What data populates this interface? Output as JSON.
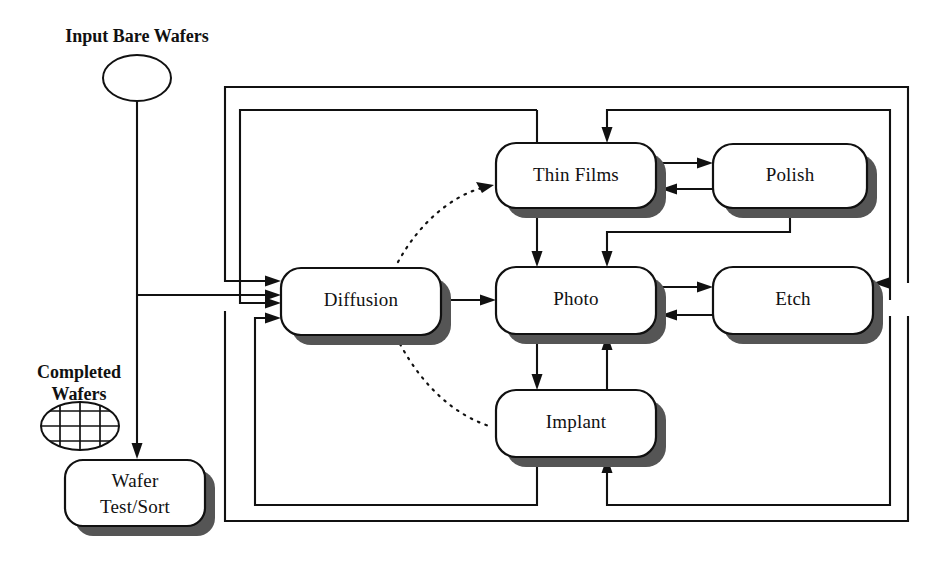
{
  "diagram": {
    "type": "flowchart",
    "canvas": {
      "width": 939,
      "height": 561
    },
    "colors": {
      "stroke": "#111111",
      "fill": "#ffffff",
      "shadow": "#555555",
      "background": "#ffffff"
    }
  },
  "captions": {
    "input": {
      "line1": "Input Bare Wafers"
    },
    "completed": {
      "line1": "Completed",
      "line2": "Wafers"
    }
  },
  "terminals": [
    {
      "id": "input-bare-wafers",
      "shape": "ellipse",
      "label": "",
      "cx": 137,
      "cy": 78,
      "rx": 34,
      "ry": 23
    },
    {
      "id": "completed-wafers",
      "shape": "ellipse-grid",
      "label": "",
      "cx": 80,
      "cy": 426,
      "rx": 39,
      "ry": 24
    }
  ],
  "nodes": [
    {
      "id": "diffusion",
      "label": "Diffusion",
      "x": 281,
      "y": 268,
      "w": 160,
      "h": 67,
      "lines": 1
    },
    {
      "id": "thin-films",
      "label": "Thin Films",
      "x": 496,
      "y": 143,
      "w": 160,
      "h": 65,
      "lines": 1
    },
    {
      "id": "polish",
      "label": "Polish",
      "x": 713,
      "y": 144,
      "w": 154,
      "h": 64,
      "lines": 1
    },
    {
      "id": "photo",
      "label": "Photo",
      "x": 496,
      "y": 267,
      "w": 160,
      "h": 67,
      "lines": 1
    },
    {
      "id": "etch",
      "label": "Etch",
      "x": 713,
      "y": 267,
      "w": 160,
      "h": 67,
      "lines": 1
    },
    {
      "id": "implant",
      "label": "Implant",
      "x": 496,
      "y": 390,
      "w": 160,
      "h": 67,
      "lines": 1
    },
    {
      "id": "wafer-test-sort",
      "label": "Wafer",
      "label2": "Test/Sort",
      "x": 65,
      "y": 460,
      "w": 140,
      "h": 66,
      "lines": 2
    }
  ],
  "edges": [
    {
      "id": "input-to-diffusion",
      "from": "input-bare-wafers",
      "to": "diffusion",
      "style": "solid",
      "arrow": true
    },
    {
      "id": "input-to-wafer-test",
      "from": "input-bare-wafers",
      "to": "wafer-test-sort",
      "style": "solid",
      "arrow": true
    },
    {
      "id": "diffusion-to-photo",
      "from": "diffusion",
      "to": "photo",
      "style": "solid",
      "arrow": true
    },
    {
      "id": "diffusion-to-thin-films",
      "from": "diffusion",
      "to": "thin-films",
      "style": "dotted",
      "arrow": true
    },
    {
      "id": "diffusion-to-implant",
      "from": "diffusion",
      "to": "implant",
      "style": "dotted",
      "arrow": false
    },
    {
      "id": "thin-films-to-polish",
      "from": "thin-films",
      "to": "polish",
      "style": "solid",
      "arrow": true
    },
    {
      "id": "polish-to-thin-films",
      "from": "polish",
      "to": "thin-films",
      "style": "solid",
      "arrow": true
    },
    {
      "id": "thin-films-to-photo",
      "from": "thin-films",
      "to": "photo",
      "style": "solid",
      "arrow": true
    },
    {
      "id": "polish-to-photo",
      "from": "polish",
      "to": "photo",
      "style": "solid",
      "arrow": true
    },
    {
      "id": "photo-to-etch",
      "from": "photo",
      "to": "etch",
      "style": "solid",
      "arrow": true
    },
    {
      "id": "etch-to-photo",
      "from": "etch",
      "to": "photo",
      "style": "solid",
      "arrow": true
    },
    {
      "id": "photo-to-implant",
      "from": "photo",
      "to": "implant",
      "style": "solid",
      "arrow": true
    },
    {
      "id": "implant-to-photo",
      "from": "implant",
      "to": "photo",
      "style": "solid",
      "arrow": true
    },
    {
      "id": "top-return-outer",
      "from": "etch",
      "to": "diffusion",
      "style": "solid",
      "arrow": true
    },
    {
      "id": "top-return-inner",
      "from": "etch",
      "to": "thin-films",
      "style": "solid",
      "arrow": true
    },
    {
      "id": "bottom-return-inner",
      "from": "implant",
      "to": "diffusion",
      "style": "solid",
      "arrow": true
    },
    {
      "id": "bottom-return-outer",
      "from": "etch",
      "to": "diffusion",
      "style": "solid",
      "arrow": true
    },
    {
      "id": "etch-to-implant",
      "from": "etch",
      "to": "implant",
      "style": "solid",
      "arrow": true
    }
  ]
}
